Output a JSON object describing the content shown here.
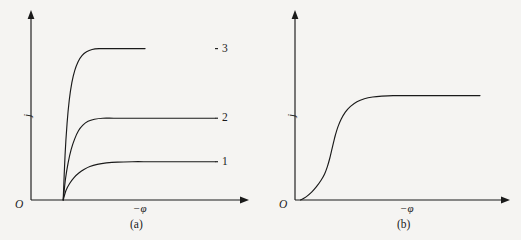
{
  "figure": {
    "background_color": "#f5f4f2",
    "ink_color": "#1a1a1a",
    "panel_count": 2
  },
  "chart_data": [
    {
      "type": "line",
      "panel": "a",
      "caption": "(a)",
      "title": "",
      "subtitle": "",
      "xlabel": "−φ",
      "ylabel": "j",
      "origin_label": "O",
      "grid": false,
      "legend_position": "right-inline",
      "xlim": [
        0,
        1
      ],
      "ylim": [
        0,
        1
      ],
      "axis_ticks": false,
      "tick_labels": [],
      "description": "Three limiting-current polarization curves rising from a common foot and saturating at three different plateau levels.",
      "series": [
        {
          "name": "1",
          "label": "1",
          "plateau": 0.22,
          "foot_x": 0.175,
          "rise_rate": 22,
          "x": [
            0.175,
            0.19,
            0.21,
            0.235,
            0.26,
            0.29,
            0.32,
            0.36,
            0.41,
            0.47,
            0.55,
            0.65,
            0.78,
            0.92,
            1.0
          ],
          "y": [
            0.0,
            0.055,
            0.095,
            0.13,
            0.155,
            0.177,
            0.193,
            0.205,
            0.213,
            0.218,
            0.22,
            0.22,
            0.22,
            0.22,
            0.22
          ]
        },
        {
          "name": "2",
          "label": "2",
          "plateau": 0.47,
          "foot_x": 0.175,
          "rise_rate": 30,
          "x": [
            0.175,
            0.188,
            0.202,
            0.218,
            0.237,
            0.258,
            0.282,
            0.31,
            0.345,
            0.39,
            0.45,
            0.54,
            0.67,
            0.85,
            1.0
          ],
          "y": [
            0.0,
            0.125,
            0.215,
            0.29,
            0.35,
            0.398,
            0.43,
            0.452,
            0.464,
            0.47,
            0.47,
            0.47,
            0.47,
            0.47,
            0.47
          ]
        },
        {
          "name": "3",
          "label": "3",
          "plateau": 0.87,
          "foot_x": 0.175,
          "rise_rate": 46,
          "x": [
            0.175,
            0.185,
            0.196,
            0.208,
            0.222,
            0.238,
            0.256,
            0.277,
            0.302,
            0.332,
            0.37,
            0.42,
            0.5,
            0.62,
            0.8,
            1.0
          ],
          "y": [
            0.0,
            0.255,
            0.44,
            0.575,
            0.675,
            0.745,
            0.795,
            0.83,
            0.852,
            0.865,
            0.87,
            0.87,
            0.87,
            0.87,
            0.87
          ]
        }
      ]
    },
    {
      "type": "line",
      "panel": "b",
      "caption": "(b)",
      "title": "",
      "subtitle": "",
      "xlabel": "−φ",
      "ylabel": "j",
      "origin_label": "O",
      "grid": false,
      "legend_position": "none",
      "xlim": [
        0,
        1
      ],
      "ylim": [
        0,
        1
      ],
      "axis_ticks": false,
      "tick_labels": [],
      "description": "A single sigmoidal (S-shaped) polarization curve rising slowly, then steeply through an inflection, then saturating at a plateau.",
      "series": [
        {
          "name": "curve",
          "label": "",
          "plateau": 0.6,
          "inflection_x": 0.2,
          "x": [
            0.03,
            0.06,
            0.09,
            0.115,
            0.14,
            0.16,
            0.175,
            0.188,
            0.198,
            0.208,
            0.218,
            0.232,
            0.25,
            0.272,
            0.3,
            0.335,
            0.375,
            0.42,
            0.47,
            0.53,
            0.62,
            0.75,
            0.88,
            1.0
          ],
          "y": [
            0.0,
            0.018,
            0.045,
            0.075,
            0.112,
            0.15,
            0.192,
            0.24,
            0.285,
            0.33,
            0.372,
            0.42,
            0.465,
            0.505,
            0.538,
            0.565,
            0.582,
            0.592,
            0.597,
            0.6,
            0.6,
            0.6,
            0.6,
            0.6
          ]
        }
      ]
    }
  ]
}
